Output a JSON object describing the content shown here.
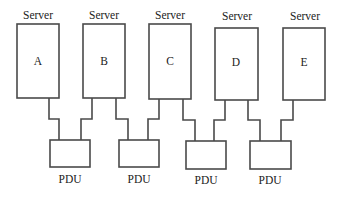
{
  "diagram": {
    "colors": {
      "stroke": "#4a4a4a",
      "text": "#222222",
      "background": "#ffffff"
    },
    "servers": [
      {
        "caption": "Server",
        "id": "A",
        "x": 17,
        "y": 24,
        "w": 42,
        "h": 74
      },
      {
        "caption": "Server",
        "id": "B",
        "x": 83,
        "y": 24,
        "w": 42,
        "h": 74
      },
      {
        "caption": "Server",
        "id": "C",
        "x": 149,
        "y": 25,
        "w": 42,
        "h": 74
      },
      {
        "caption": "Server",
        "id": "D",
        "x": 215,
        "y": 28,
        "w": 43,
        "h": 72
      },
      {
        "caption": "Server",
        "id": "E",
        "x": 283,
        "y": 28,
        "w": 42,
        "h": 72
      }
    ],
    "pdus": [
      {
        "label": "PDU",
        "x": 50,
        "y": 140,
        "w": 40,
        "h": 27
      },
      {
        "label": "PDU",
        "x": 119,
        "y": 140,
        "w": 40,
        "h": 27
      },
      {
        "label": "PDU",
        "x": 186,
        "y": 141,
        "w": 40,
        "h": 28
      },
      {
        "label": "PDU",
        "x": 250,
        "y": 141,
        "w": 41,
        "h": 28
      }
    ],
    "connections": [
      {
        "from": "A",
        "to": "PDU-1"
      },
      {
        "from": "B",
        "to": "PDU-1"
      },
      {
        "from": "B",
        "to": "PDU-2"
      },
      {
        "from": "C",
        "to": "PDU-2"
      },
      {
        "from": "C",
        "to": "PDU-3"
      },
      {
        "from": "D",
        "to": "PDU-3"
      },
      {
        "from": "D",
        "to": "PDU-4"
      },
      {
        "from": "E",
        "to": "PDU-4"
      }
    ]
  }
}
